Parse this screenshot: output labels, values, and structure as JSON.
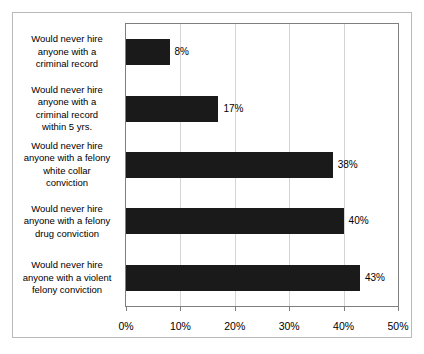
{
  "chart_data": {
    "type": "bar",
    "orientation": "horizontal",
    "title": "",
    "subtitle": "",
    "xlabel": "",
    "ylabel": "",
    "xlim": [
      0,
      50
    ],
    "grid": true,
    "legend": null,
    "legend_position": "none",
    "bar_color": "#1a1a1a",
    "gridline_color": "#d4d4d4",
    "axis_color": "#7f7f7f",
    "border_color": "#b9b9b9",
    "background_color": "#ffffff",
    "xticks": [
      {
        "value": 0,
        "label": "0%"
      },
      {
        "value": 10,
        "label": "10%"
      },
      {
        "value": 20,
        "label": "20%"
      },
      {
        "value": 30,
        "label": "30%"
      },
      {
        "value": 40,
        "label": "40%"
      },
      {
        "value": 50,
        "label": "50%"
      }
    ],
    "categories": [
      "Would never hire anyone with a criminal record",
      "Would never hire anyone with a criminal record within 5 yrs.",
      "Would never hire anyone with a felony white collar conviction",
      "Would never hire anyone with a felony drug conviction",
      "Would never hire anyone with a violent felony conviction"
    ],
    "category_lines": [
      [
        "Would never hire",
        "anyone with a",
        "criminal record"
      ],
      [
        "Would never hire",
        "anyone with a",
        "criminal record",
        "within 5 yrs."
      ],
      [
        "Would never hire",
        "anyone with a felony",
        "white collar",
        "conviction"
      ],
      [
        "Would never hire",
        "anyone with a felony",
        "drug conviction"
      ],
      [
        "Would never hire",
        "anyone with a violent",
        "felony conviction"
      ]
    ],
    "values": [
      8,
      17,
      38,
      40,
      43
    ],
    "value_labels": [
      "8%",
      "17%",
      "38%",
      "40%",
      "43%"
    ]
  }
}
